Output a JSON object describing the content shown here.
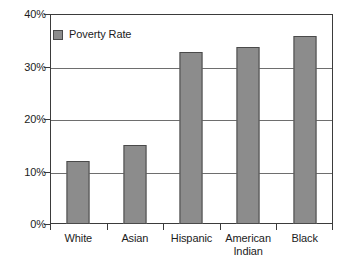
{
  "chart_data": {
    "type": "bar",
    "title": "",
    "xlabel": "",
    "ylabel": "",
    "categories": [
      "White",
      "Asian",
      "Hispanic",
      "American Indian",
      "Black"
    ],
    "category_lines": [
      [
        "White"
      ],
      [
        "Asian"
      ],
      [
        "Hispanic"
      ],
      [
        "American",
        "Indian"
      ],
      [
        "Black"
      ]
    ],
    "series": [
      {
        "name": "Poverty Rate",
        "values": [
          12.0,
          15.0,
          32.7,
          33.8,
          35.8
        ],
        "color": "#8c8c8c"
      }
    ],
    "values": [
      12.0,
      15.0,
      32.7,
      33.8,
      35.8
    ],
    "ylim": [
      0,
      40
    ],
    "ytick_values": [
      0,
      10,
      20,
      30,
      40
    ],
    "ytick_labels": [
      "0%",
      "10%",
      "20%",
      "30%",
      "40%"
    ],
    "grid": true,
    "grid_axis": "y",
    "legend": {
      "position": "inside-top-left",
      "entries": [
        {
          "label": "Poverty Rate",
          "color": "#8c8c8c"
        }
      ]
    },
    "axis_color": "#3b3b3b",
    "gridline_color": "#6e6e6e",
    "bar_border_color": "#4a4a4a",
    "background": "#ffffff"
  }
}
